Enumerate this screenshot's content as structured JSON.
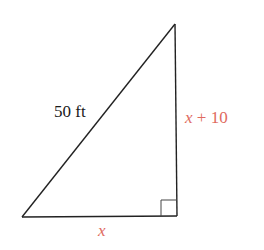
{
  "diagram": {
    "type": "right-triangle",
    "vertices": {
      "bottom_left": [
        22,
        217
      ],
      "top": [
        175,
        24
      ],
      "bottom_right": [
        177,
        216
      ]
    },
    "right_angle_marker": {
      "corner": "bottom_right",
      "size": 16
    },
    "labels": {
      "hypotenuse": "50 ft",
      "vertical_leg_var": "x",
      "vertical_leg_rest": " + 10",
      "horizontal_leg": "x"
    },
    "colors": {
      "line": "#222222",
      "hypotenuse_label": "#1a1a1a",
      "variable_label": "#e06a60"
    }
  }
}
